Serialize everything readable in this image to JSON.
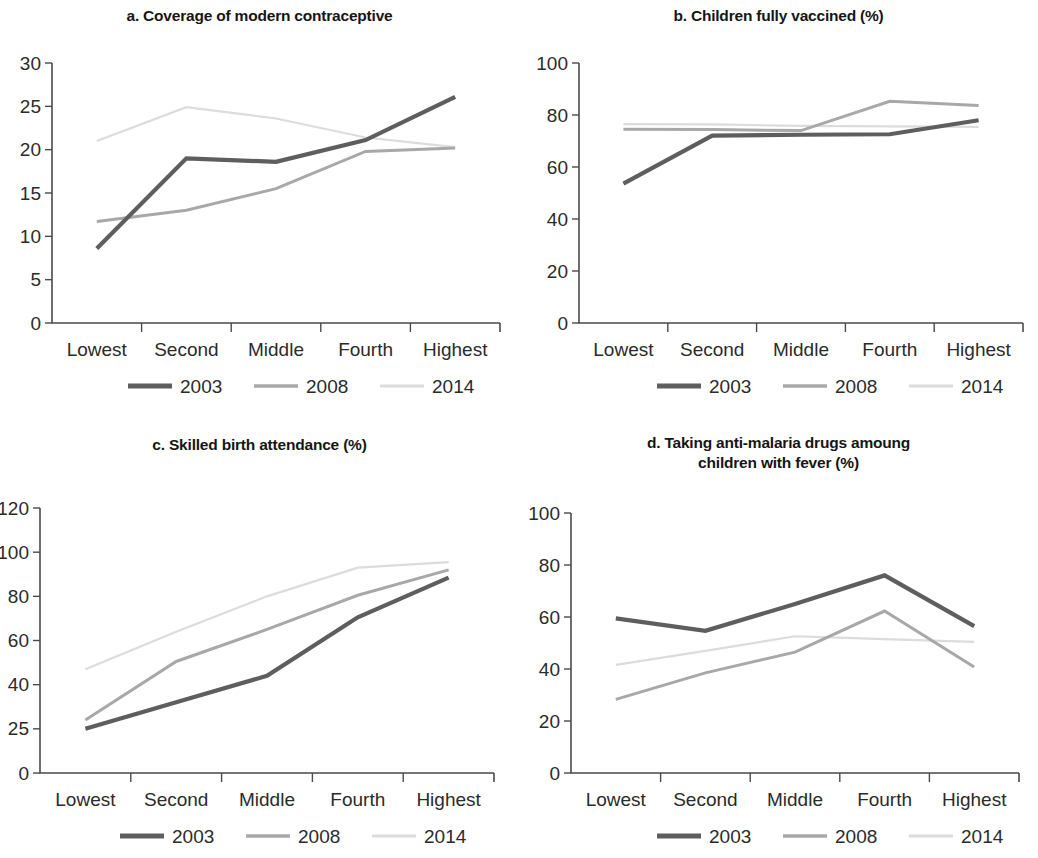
{
  "figure": {
    "categories": [
      "Lowest",
      "Second",
      "Middle",
      "Fourth",
      "Highest"
    ],
    "legend": [
      {
        "label": "2003",
        "color": "#5e5e5e",
        "width": 4.2
      },
      {
        "label": "2008",
        "color": "#a8a8a8",
        "width": 3.0
      },
      {
        "label": "2014",
        "color": "#dcdcdc",
        "width": 2.2
      }
    ]
  },
  "chart_data": [
    {
      "id": "a",
      "type": "line",
      "title": "a. Coverage of modern contraceptive",
      "xlabel": "",
      "ylabel": "",
      "ylim": [
        0,
        30
      ],
      "yticks": [
        0,
        5,
        10,
        15,
        20,
        25,
        30
      ],
      "ytick_labels": [
        "0",
        "5",
        "10",
        "15",
        "20",
        "25",
        "30"
      ],
      "grid": false,
      "legend_position": "bottom",
      "categories": [
        "Lowest",
        "Second",
        "Middle",
        "Fourth",
        "Highest"
      ],
      "series": [
        {
          "name": "2003",
          "color": "#5e5e5e",
          "width": 4.2,
          "values": [
            8.6,
            19.0,
            18.6,
            21.1,
            26.1
          ]
        },
        {
          "name": "2008",
          "color": "#a8a8a8",
          "width": 3.0,
          "values": [
            11.7,
            13.0,
            15.5,
            19.8,
            20.2
          ]
        },
        {
          "name": "2014",
          "color": "#dcdcdc",
          "width": 2.2,
          "values": [
            21.0,
            24.9,
            23.6,
            21.4,
            20.3
          ]
        }
      ]
    },
    {
      "id": "b",
      "type": "line",
      "title": "b. Children fully vaccined (%)",
      "xlabel": "",
      "ylabel": "",
      "ylim": [
        0,
        100
      ],
      "yticks": [
        0,
        20,
        40,
        60,
        80,
        100
      ],
      "ytick_labels": [
        "0",
        "20",
        "40",
        "60",
        "80",
        "100"
      ],
      "grid": false,
      "legend_position": "bottom",
      "categories": [
        "Lowest",
        "Second",
        "Middle",
        "Fourth",
        "Highest"
      ],
      "series": [
        {
          "name": "2003",
          "color": "#5e5e5e",
          "width": 4.2,
          "values": [
            53.6,
            72.1,
            72.4,
            72.6,
            78.0
          ]
        },
        {
          "name": "2008",
          "color": "#a8a8a8",
          "width": 3.0,
          "values": [
            74.5,
            74.4,
            74.0,
            85.3,
            83.7
          ]
        },
        {
          "name": "2014",
          "color": "#dcdcdc",
          "width": 2.2,
          "values": [
            76.5,
            76.4,
            75.8,
            75.6,
            75.4
          ]
        }
      ]
    },
    {
      "id": "c",
      "type": "line",
      "title": "c. Skilled birth attendance (%)",
      "xlabel": "",
      "ylabel": "",
      "ylim": [
        0,
        120
      ],
      "yticks": [
        0,
        25,
        40,
        60,
        80,
        100,
        120
      ],
      "ytick_labels": [
        "0",
        "25",
        "40",
        "60",
        "80",
        "100",
        "120"
      ],
      "ytick_spacing": "even",
      "grid": false,
      "legend_position": "bottom",
      "categories": [
        "Lowest",
        "Second",
        "Middle",
        "Fourth",
        "Highest"
      ],
      "series": [
        {
          "name": "2003",
          "color": "#5e5e5e",
          "width": 4.2,
          "values": [
            25.0,
            34.0,
            44.0,
            70.5,
            88.5
          ]
        },
        {
          "name": "2008",
          "color": "#a8a8a8",
          "width": 3.0,
          "values": [
            28.0,
            50.5,
            65.0,
            80.5,
            92.0
          ]
        },
        {
          "name": "2014",
          "color": "#dcdcdc",
          "width": 2.2,
          "values": [
            47.0,
            64.0,
            80.0,
            93.0,
            95.5
          ]
        }
      ]
    },
    {
      "id": "d",
      "type": "line",
      "title": "d. Taking anti-malaria drugs amoung\nchildren with fever (%)",
      "xlabel": "",
      "ylabel": "",
      "ylim": [
        0,
        100
      ],
      "yticks": [
        0,
        20,
        40,
        60,
        80,
        100
      ],
      "ytick_labels": [
        "0",
        "20",
        "40",
        "60",
        "80",
        "100"
      ],
      "grid": false,
      "legend_position": "bottom",
      "categories": [
        "Lowest",
        "Second",
        "Middle",
        "Fourth",
        "Highest"
      ],
      "series": [
        {
          "name": "2003",
          "color": "#5e5e5e",
          "width": 4.2,
          "values": [
            59.5,
            54.7,
            65.0,
            76.0,
            56.5
          ]
        },
        {
          "name": "2008",
          "color": "#a8a8a8",
          "width": 3.0,
          "values": [
            28.3,
            38.5,
            46.5,
            62.3,
            40.8
          ]
        },
        {
          "name": "2014",
          "color": "#dcdcdc",
          "width": 2.2,
          "values": [
            41.6,
            47.0,
            52.6,
            51.5,
            50.4
          ]
        }
      ]
    }
  ]
}
